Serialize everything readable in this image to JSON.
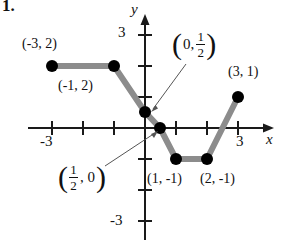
{
  "figure": {
    "problem_number": "1.",
    "axes": {
      "x_label": "x",
      "y_label": "y",
      "x_ticks": [
        {
          "label": "-3",
          "value": -3
        },
        {
          "label": "3",
          "value": 3
        }
      ],
      "y_ticks": [
        {
          "label": "3",
          "value": 3
        },
        {
          "label": "-3",
          "value": -3
        }
      ],
      "x_range": [
        -3.8,
        3.8
      ],
      "y_range": [
        -3.4,
        3.4
      ],
      "origin_px": [
        145,
        128
      ],
      "unit_px": 31,
      "axis_color": "#1a1a1a"
    },
    "curve": {
      "color": "#8c8c8c",
      "point_color": "#000000",
      "vertices": [
        {
          "x": -3,
          "y": 2
        },
        {
          "x": -1,
          "y": 2
        },
        {
          "x": 0,
          "y": 0.5
        },
        {
          "x": 0.5,
          "y": 0
        },
        {
          "x": 1,
          "y": -1
        },
        {
          "x": 2,
          "y": -1
        },
        {
          "x": 3,
          "y": 1
        }
      ]
    },
    "labels": {
      "p_neg3_2": "(-3, 2)",
      "p_neg1_2": "(-1, 2)",
      "p_3_1": "(3, 1)",
      "p_1_neg1": "(1, -1)",
      "p_2_neg1": "(2, -1)",
      "p_0_half": {
        "open": "(",
        "x": "0,",
        "num": "1",
        "den": "2",
        "close": ")"
      },
      "p_half_0": {
        "open": "(",
        "num": "1",
        "den": "2",
        "x": ", 0",
        "close": ")"
      }
    }
  }
}
